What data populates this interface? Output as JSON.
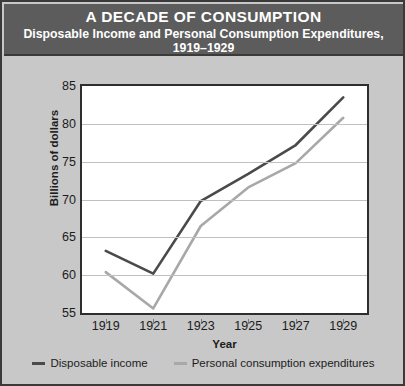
{
  "title": "A DECADE OF CONSUMPTION",
  "subtitle": "Disposable Income and Personal Consumption Expenditures, 1919–1929",
  "colors": {
    "background": "#c8c8c8",
    "title_band": "#5c5c5c",
    "title_text": "#ffffff",
    "plot_background": "#ffffff",
    "frame": "#2e2e2e",
    "grid": "#c0c0c0",
    "disposable_income": "#4a4a4a",
    "personal_consumption": "#a8a8a8"
  },
  "axes": {
    "ylabel": "Billions of dollars",
    "xlabel": "Year",
    "yticks": [
      "85",
      "80",
      "75",
      "70",
      "65",
      "60",
      "55"
    ],
    "xticks": [
      "1919",
      "1921",
      "1923",
      "1925",
      "1927",
      "1929"
    ]
  },
  "legend": {
    "items": [
      {
        "label": "Disposable income",
        "color": "#4a4a4a"
      },
      {
        "label": "Personal consumption expenditures",
        "color": "#a8a8a8"
      }
    ]
  },
  "chart_data": {
    "type": "line",
    "title": "A DECADE OF CONSUMPTION",
    "subtitle": "Disposable Income and Personal Consumption Expenditures, 1919–1929",
    "xlabel": "Year",
    "ylabel": "Billions of dollars",
    "x": [
      1919,
      1921,
      1923,
      1925,
      1927,
      1929
    ],
    "categories": [
      "1919",
      "1921",
      "1923",
      "1925",
      "1927",
      "1929"
    ],
    "series": [
      {
        "name": "Disposable income",
        "color": "#4a4a4a",
        "values": [
          63.2,
          60.2,
          69.8,
          73.4,
          77.2,
          83.5
        ]
      },
      {
        "name": "Personal consumption expenditures",
        "color": "#a8a8a8",
        "values": [
          60.4,
          55.6,
          66.5,
          71.6,
          74.8,
          80.8
        ]
      }
    ],
    "xlim": [
      1918,
      1930
    ],
    "ylim": [
      55,
      85
    ],
    "ytick_values": [
      55,
      60,
      65,
      70,
      75,
      80,
      85
    ],
    "grid": true,
    "grid_axis": "y",
    "legend_position": "bottom"
  }
}
